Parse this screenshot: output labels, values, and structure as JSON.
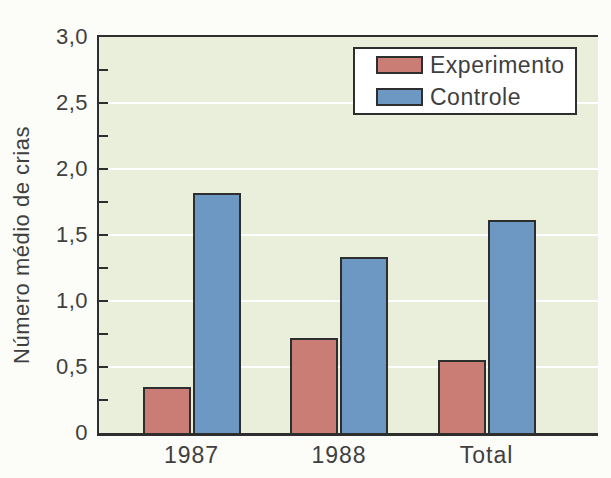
{
  "colors": {
    "page_bg": "#fcfcf9",
    "plot_bg": "#eaefdc",
    "experimento": "#ca7d74",
    "controle": "#6c98c3",
    "bar_border": "#2e2e2e",
    "gridline": "#ffffff",
    "axis": "#2e2e2e",
    "text": "#3f3f3f",
    "legend_bg": "#ffffff"
  },
  "chart_data": {
    "type": "bar",
    "categories": [
      "1987",
      "1988",
      "Total"
    ],
    "series": [
      {
        "name": "Experimento",
        "color_key": "experimento",
        "values": [
          0.35,
          0.72,
          0.55
        ]
      },
      {
        "name": "Controle",
        "color_key": "controle",
        "values": [
          1.82,
          1.33,
          1.61
        ]
      }
    ],
    "title": "",
    "xlabel": "",
    "ylabel": "Número médio de crias",
    "ylim": [
      0,
      3
    ],
    "yticks": [
      {
        "v": 0,
        "label": "0"
      },
      {
        "v": 0.5,
        "label": "0,5"
      },
      {
        "v": 1,
        "label": "1,0"
      },
      {
        "v": 1.5,
        "label": "1,5"
      },
      {
        "v": 2,
        "label": "2,0"
      },
      {
        "v": 2.5,
        "label": "2,5"
      },
      {
        "v": 3,
        "label": "3,0"
      }
    ],
    "minor_tick_step": 0.25,
    "grid": true,
    "decimal_separator": ",",
    "legend_position": "top-right"
  }
}
